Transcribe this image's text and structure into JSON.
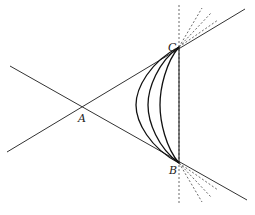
{
  "diagram": {
    "points": {
      "A": {
        "label": "A",
        "x": 82,
        "y": 107
      },
      "B": {
        "label": "B",
        "x": 179,
        "y": 163
      },
      "C": {
        "label": "C",
        "x": 179,
        "y": 47
      }
    },
    "labels": {
      "A": "A",
      "B": "B",
      "C": "C"
    },
    "lines": [
      {
        "name": "line-through-A-C",
        "style": "solid"
      },
      {
        "name": "line-through-A-B",
        "style": "solid"
      },
      {
        "name": "segment-C-B",
        "style": "solid"
      },
      {
        "name": "vertical-through-B-C",
        "style": "dashed"
      }
    ],
    "curve_count": 3,
    "dashed_rays_at_C": 3,
    "dashed_rays_at_B": 3,
    "colors": {
      "stroke": "#222222",
      "background": "#ffffff"
    }
  }
}
